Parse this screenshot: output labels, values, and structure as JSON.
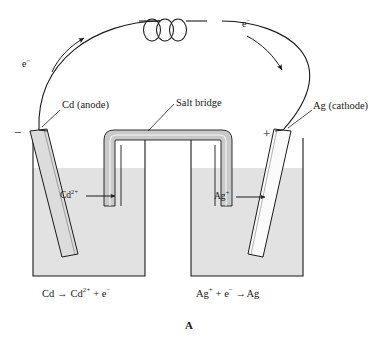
{
  "figure": {
    "label": "A",
    "type": "galvanic-cell-diagram"
  },
  "labels": {
    "anode": "Cd (anode)",
    "cathode": "Ag (cathode)",
    "salt_bridge": "Salt bridge",
    "electron_left": "e",
    "electron_left_charge": "−",
    "electron_right": "e",
    "electron_right_charge": "−",
    "negative_terminal": "−",
    "positive_terminal": "+",
    "cadmium_ion": "Cd",
    "cadmium_ion_charge": "2+",
    "cadmium_ion_arrow": "⟶",
    "silver_ion": "Ag",
    "silver_ion_charge": "+",
    "silver_ion_arrow": "⟶"
  },
  "equations": {
    "oxidation": {
      "reactant": "Cd",
      "arrow": "→",
      "product_species": "Cd",
      "product_charge": "2+",
      "plus": "+",
      "electron": "e",
      "electron_charge": "−"
    },
    "reduction": {
      "reactant_species": "Ag",
      "reactant_charge": "+",
      "plus": "+",
      "electron": "e",
      "electron_charge": "−",
      "arrow": "→",
      "product": "Ag"
    }
  },
  "colors": {
    "stroke": "#1a1a1a",
    "solution": "#e0e0e0",
    "salt_bridge_fill": "#c8c8c8",
    "salt_bridge_inner": "#ffffff",
    "cd_electrode": "#dcdcdc",
    "ag_electrode": "#fbfbfb",
    "background": "#ffffff"
  }
}
